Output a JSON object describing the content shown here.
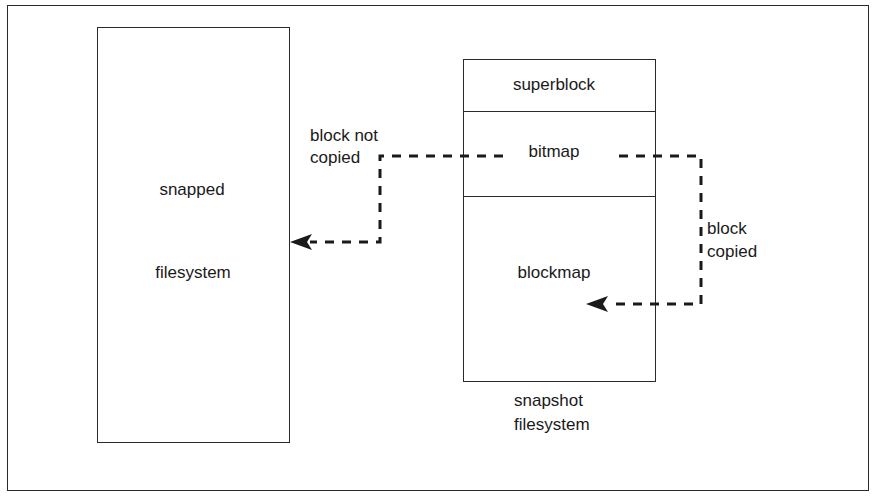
{
  "diagram": {
    "snapped_fs": {
      "line1": "snapped",
      "line2": "filesystem"
    },
    "snapshot_fs": {
      "sections": {
        "superblock": "superblock",
        "bitmap": "bitmap",
        "blockmap": "blockmap"
      },
      "caption_line1": "snapshot",
      "caption_line2": "filesystem"
    },
    "arrows": {
      "not_copied": {
        "line1": "block not",
        "line2": "copied",
        "from": "bitmap",
        "to": "snapped filesystem"
      },
      "copied": {
        "line1": "block",
        "line2": "copied",
        "from": "bitmap",
        "to": "blockmap"
      }
    },
    "colors": {
      "stroke": "#1a1a1a",
      "background": "#ffffff"
    }
  }
}
